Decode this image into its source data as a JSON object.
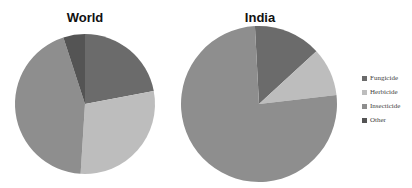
{
  "chart_data": [
    {
      "type": "pie",
      "title": "World",
      "categories": [
        "Fungicide",
        "Herbicide",
        "Insecticide",
        "Other"
      ],
      "values": [
        22,
        29,
        44,
        5
      ],
      "start_angle_deg": 0,
      "center": [
        85,
        104
      ],
      "radius": 70
    },
    {
      "type": "pie",
      "title": "India",
      "categories": [
        "Fungicide",
        "Herbicide",
        "Insecticide",
        "Other"
      ],
      "values": [
        14,
        10,
        76,
        0
      ],
      "start_angle_deg": -3,
      "center": [
        259,
        104
      ],
      "radius": 78
    }
  ],
  "legend": {
    "position": "right",
    "items": [
      {
        "label": "Fungicide",
        "color": "#6b6b6b"
      },
      {
        "label": "Herbicide",
        "color": "#bdbdbd"
      },
      {
        "label": "Insecticide",
        "color": "#8e8e8e"
      },
      {
        "label": "Other",
        "color": "#545454"
      }
    ]
  },
  "titles": {
    "world": "World",
    "india": "India"
  }
}
